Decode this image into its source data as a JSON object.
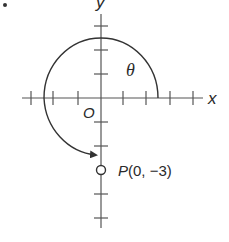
{
  "figure": {
    "number_label": "7.",
    "x_axis_label": "x",
    "y_axis_label": "y",
    "origin_label": "O",
    "angle_label": "θ",
    "point_label": "P(0, −3)",
    "point": {
      "name": "P",
      "x": 0,
      "y": -3
    },
    "tick_unit": 1,
    "x_ticks": [
      -4,
      -3,
      -2,
      1,
      2,
      3,
      4
    ],
    "y_ticks": [
      3,
      2,
      1,
      -1,
      -2,
      -4,
      -5
    ],
    "arc": {
      "from": "positive x-axis",
      "direction": "counterclockwise",
      "to": "P(0, -3)",
      "arrow": true
    },
    "colors": {
      "stroke": "#333333",
      "background": "#ffffff"
    }
  }
}
